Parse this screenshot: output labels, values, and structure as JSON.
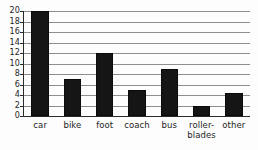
{
  "chart_data": {
    "type": "bar",
    "title": "",
    "subtitle": "",
    "xlabel": "",
    "ylabel": "",
    "categories": [
      "car",
      "bike",
      "foot",
      "coach",
      "bus",
      "roller-\nblades",
      "other"
    ],
    "values": [
      20,
      7,
      12,
      5,
      9,
      2,
      4.3
    ],
    "ylim": [
      0,
      20
    ],
    "ytick_labels": [
      "0",
      "2",
      "4",
      "6",
      "8",
      "10",
      "12",
      "14",
      "16",
      "18",
      "20"
    ],
    "ytick_values": [
      0,
      2,
      4,
      6,
      8,
      10,
      12,
      14,
      16,
      18,
      20
    ],
    "grid": true,
    "grid_axis": "y",
    "legend": false,
    "legend_position": "none",
    "bar_color": "#151515",
    "grid_color": "#8e8e8e",
    "axis_color": "#2a2a2a",
    "annotations": []
  }
}
